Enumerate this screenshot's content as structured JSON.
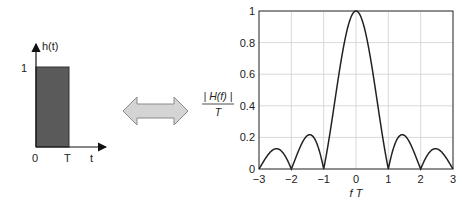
{
  "time_domain": {
    "axis_y_label": "h(t)",
    "axis_x_label": "t",
    "y_tick": "1",
    "x_ticks": [
      "0",
      "T"
    ],
    "pulse_color": "#5a5a5a"
  },
  "transform_arrow": {
    "icon": "double-arrow-icon",
    "fill": "#d4d4d4",
    "stroke": "#8a8a8a"
  },
  "freq_domain": {
    "ylabel_numerator": "| H(f) |",
    "ylabel_denominator": "T",
    "xlabel": "f T"
  },
  "chart_data": {
    "type": "line",
    "title": "",
    "xlabel": "f T",
    "ylabel": "|H(f)| / T",
    "xlim": [
      -3,
      3
    ],
    "ylim": [
      0,
      1
    ],
    "xticks": [
      "-3",
      "-2",
      "-1",
      "0",
      "1",
      "2",
      "3"
    ],
    "yticks": [
      "0",
      "0.2",
      "0.4",
      "0.6",
      "0.8",
      "1"
    ],
    "grid": true,
    "series": [
      {
        "name": "|sinc(fT)|",
        "x": [
          -3,
          -2.5,
          -2,
          -1.43,
          -1,
          -0.5,
          0,
          0.5,
          1,
          1.43,
          2,
          2.5,
          3
        ],
        "values": [
          0,
          0.127,
          0,
          0.217,
          0,
          0.637,
          1,
          0.637,
          0,
          0.217,
          0,
          0.127,
          0
        ]
      }
    ]
  }
}
